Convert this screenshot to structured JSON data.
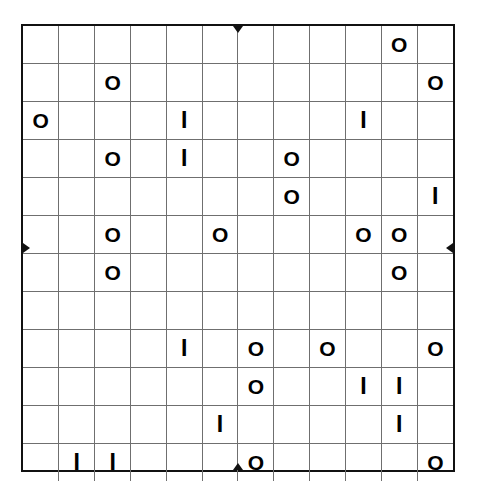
{
  "puzzle": {
    "name": "binary-grid-puzzle",
    "rows": 12,
    "columns": 12,
    "symbols": {
      "circle": "O",
      "bar": "I",
      "blank": ""
    },
    "colors": {
      "grid_line": "#6f6f6f",
      "outer_border": "#111111",
      "glyph": "#000000",
      "background": "#ffffff"
    },
    "center_ticks": {
      "top": "▼",
      "bottom": "▲",
      "left": "▶",
      "right": "◀"
    },
    "grid": [
      [
        "",
        "",
        "",
        "",
        "",
        "",
        "",
        "",
        "",
        "",
        "O",
        ""
      ],
      [
        "",
        "",
        "O",
        "",
        "",
        "",
        "",
        "",
        "",
        "",
        "",
        "O"
      ],
      [
        "O",
        "",
        "",
        "",
        "I",
        "",
        "",
        "",
        "",
        "I",
        "",
        ""
      ],
      [
        "",
        "",
        "O",
        "",
        "I",
        "",
        "",
        "O",
        "",
        "",
        "",
        ""
      ],
      [
        "",
        "",
        "",
        "",
        "",
        "",
        "",
        "O",
        "",
        "",
        "",
        "I"
      ],
      [
        "",
        "",
        "O",
        "",
        "",
        "O",
        "",
        "",
        "",
        "O",
        "O",
        ""
      ],
      [
        "",
        "",
        "O",
        "",
        "",
        "",
        "",
        "",
        "",
        "",
        "O",
        ""
      ],
      [
        "",
        "",
        "",
        "",
        "",
        "",
        "",
        "",
        "",
        "",
        "",
        ""
      ],
      [
        "",
        "",
        "",
        "",
        "I",
        "",
        "O",
        "",
        "O",
        "",
        "",
        "O"
      ],
      [
        "",
        "",
        "",
        "",
        "",
        "",
        "O",
        "",
        "",
        "I",
        "I",
        ""
      ],
      [
        "",
        "",
        "",
        "",
        "",
        "I",
        "",
        "",
        "",
        "",
        "I",
        ""
      ],
      [
        "",
        "I",
        "I",
        "",
        "",
        "",
        "O",
        "",
        "",
        "",
        "",
        "O"
      ]
    ]
  }
}
